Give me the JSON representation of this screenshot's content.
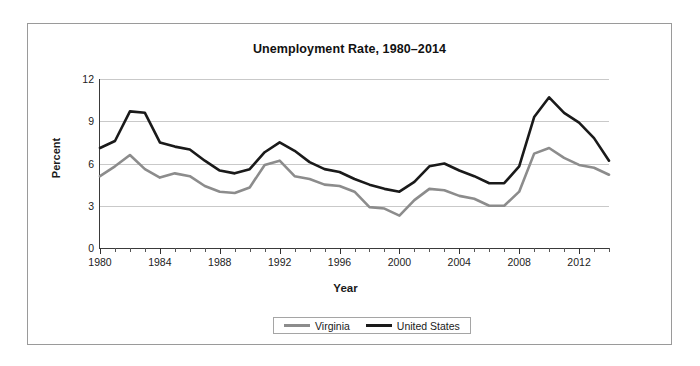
{
  "chart_data": {
    "type": "line",
    "title": "Unemployment Rate, 1980–2014",
    "xlabel": "Year",
    "ylabel": "Percent",
    "xlim": [
      1980,
      2014
    ],
    "ylim": [
      0,
      12
    ],
    "yticks": [
      0,
      3,
      6,
      9,
      12
    ],
    "xticks": [
      1980,
      1984,
      1988,
      1992,
      1996,
      2000,
      2004,
      2008,
      2012
    ],
    "grid": "horizontal",
    "legend_position": "bottom-center",
    "x": [
      1980,
      1981,
      1982,
      1983,
      1984,
      1985,
      1986,
      1987,
      1988,
      1989,
      1990,
      1991,
      1992,
      1993,
      1994,
      1995,
      1996,
      1997,
      1998,
      1999,
      2000,
      2001,
      2002,
      2003,
      2004,
      2005,
      2006,
      2007,
      2008,
      2009,
      2010,
      2011,
      2012,
      2013,
      2014
    ],
    "series": [
      {
        "name": "Virginia",
        "color": "#8c8c8c",
        "values": [
          5.1,
          5.8,
          6.6,
          5.6,
          5.0,
          5.3,
          5.1,
          4.4,
          4.0,
          3.9,
          4.3,
          5.9,
          6.2,
          5.1,
          4.9,
          4.5,
          4.4,
          4.0,
          2.9,
          2.8,
          2.3,
          3.4,
          4.2,
          4.1,
          3.7,
          3.5,
          3.0,
          3.0,
          4.0,
          6.7,
          7.1,
          6.4,
          5.9,
          5.7,
          5.2
        ]
      },
      {
        "name": "United States",
        "color": "#1a1a1a",
        "values": [
          7.1,
          7.6,
          9.7,
          9.6,
          7.5,
          7.2,
          7.0,
          6.2,
          5.5,
          5.3,
          5.6,
          6.8,
          7.5,
          6.9,
          6.1,
          5.6,
          5.4,
          4.9,
          4.5,
          4.2,
          4.0,
          4.7,
          5.8,
          6.0,
          5.5,
          5.1,
          4.6,
          4.6,
          5.8,
          9.3,
          10.7,
          9.6,
          8.9,
          7.8,
          6.2
        ]
      }
    ]
  },
  "legend": {
    "items": [
      {
        "label": "Virginia",
        "color": "#8c8c8c"
      },
      {
        "label": "United States",
        "color": "#1a1a1a"
      }
    ]
  }
}
